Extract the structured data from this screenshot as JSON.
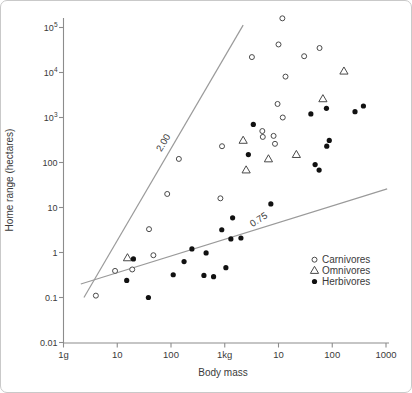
{
  "chart_data": {
    "type": "scatter",
    "title": "",
    "xlabel": "Body mass",
    "ylabel": "Home range (hectares)",
    "x_axis": {
      "scale": "log",
      "tick_labels": [
        "1g",
        "10",
        "100",
        "1kg",
        "10",
        "100",
        "1000"
      ],
      "tick_values_grams": [
        1,
        10,
        100,
        1000,
        10000,
        100000,
        1000000
      ],
      "range_grams": [
        1,
        1000000
      ]
    },
    "y_axis": {
      "scale": "log",
      "tick_labels": [
        "10^5",
        "10^4",
        "10^3",
        "100",
        "10",
        "1",
        "0.1",
        "0.01"
      ],
      "tick_values_hectares": [
        100000,
        10000,
        1000,
        100,
        10,
        1,
        0.1,
        0.01
      ],
      "range_hectares": [
        0.01,
        100000
      ]
    },
    "guide_lines": [
      {
        "label": "2.00",
        "slope": 2.0,
        "endpoints_mass_g_hectares": [
          [
            2.4,
            0.1
          ],
          [
            2200,
            113000
          ]
        ]
      },
      {
        "label": "0.75",
        "slope": 0.75,
        "endpoints_mass_g_hectares": [
          [
            2.1,
            0.2
          ],
          [
            1050000,
            26
          ]
        ]
      }
    ],
    "legend": {
      "position": "lower-right",
      "entries": [
        {
          "label": "Carnivores",
          "marker": "open-circle"
        },
        {
          "label": "Omnivores",
          "marker": "open-triangle"
        },
        {
          "label": "Herbivores",
          "marker": "filled-circle"
        }
      ]
    },
    "series": [
      {
        "name": "Carnivores",
        "marker": "open-circle",
        "points_mass_g_hectares": [
          [
            11800,
            160000
          ],
          [
            10000,
            42000
          ],
          [
            58000,
            35000
          ],
          [
            30000,
            23000
          ],
          [
            3200,
            22000
          ],
          [
            13500,
            8100
          ],
          [
            9600,
            2000
          ],
          [
            12000,
            1000
          ],
          [
            5000,
            500
          ],
          [
            5100,
            370
          ],
          [
            8100,
            390
          ],
          [
            8600,
            260
          ],
          [
            890,
            230
          ],
          [
            140,
            120
          ],
          [
            85,
            20
          ],
          [
            830,
            16
          ],
          [
            39,
            3.3
          ],
          [
            47,
            0.87
          ],
          [
            19,
            0.42
          ],
          [
            9.1,
            0.39
          ],
          [
            4,
            0.11
          ]
        ]
      },
      {
        "name": "Omnivores",
        "marker": "open-triangle",
        "points_mass_g_hectares": [
          [
            165000,
            10700
          ],
          [
            67000,
            2600
          ],
          [
            21500,
            150
          ],
          [
            6500,
            120
          ],
          [
            2200,
            310
          ],
          [
            2500,
            68
          ],
          [
            15.5,
            0.76
          ]
        ]
      },
      {
        "name": "Herbivores",
        "marker": "filled-circle",
        "points_mass_g_hectares": [
          [
            78000,
            1600
          ],
          [
            40000,
            1200
          ],
          [
            380000,
            1800
          ],
          [
            265000,
            1350
          ],
          [
            3400,
            700
          ],
          [
            2750,
            150
          ],
          [
            88000,
            310
          ],
          [
            79000,
            230
          ],
          [
            48000,
            90
          ],
          [
            57000,
            68
          ],
          [
            7200,
            12
          ],
          [
            1400,
            5.9
          ],
          [
            880,
            3.2
          ],
          [
            1300,
            2.0
          ],
          [
            2000,
            2.1
          ],
          [
            245,
            1.2
          ],
          [
            450,
            0.98
          ],
          [
            1050,
            0.46
          ],
          [
            410,
            0.31
          ],
          [
            620,
            0.29
          ],
          [
            110,
            0.32
          ],
          [
            175,
            0.63
          ],
          [
            20,
            0.72
          ],
          [
            15,
            0.24
          ],
          [
            38,
            0.1
          ]
        ]
      }
    ],
    "colors": {
      "axis": "#8c8c8c",
      "guide_line": "#9a9a9a",
      "marker_stroke": "#4a4a4a",
      "marker_fill": "#111111",
      "text": "#3a3a3a",
      "background": "#ffffff",
      "border": "#c9c9c9"
    }
  }
}
